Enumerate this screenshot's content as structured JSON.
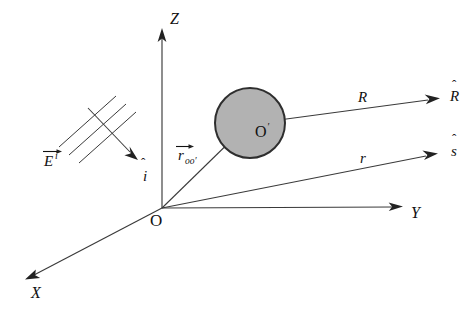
{
  "figure": {
    "background_color": "#ffffff",
    "line_color": "#3a3a3a",
    "sphere_fill_color": "#b2b2b2",
    "sphere_stroke_color": "#2e2e2e"
  },
  "axes": {
    "z": {
      "label": "Z",
      "name": "z-axis"
    },
    "y": {
      "label": "Y",
      "name": "y-axis"
    },
    "x": {
      "label": "X",
      "name": "x-axis"
    }
  },
  "origins": {
    "global": {
      "label": "O"
    },
    "local": {
      "label": "O",
      "prime": "′"
    }
  },
  "vectors": {
    "r_oo_prime": {
      "base": "r",
      "subscript": "oo′",
      "description": "position vector from O to O-prime"
    },
    "R": {
      "label": "R",
      "unit_base": "R",
      "unit_hat": "ˆ",
      "description": "scattered direction from sphere center"
    },
    "r": {
      "label": "r",
      "unit_base": "s",
      "unit_hat": "ˆ",
      "description": "observation direction from global origin"
    },
    "incident_field": {
      "base": "E",
      "superscript": "i",
      "description": "incident electric field"
    },
    "incident_direction": {
      "base": "i",
      "hat": "ˆ",
      "description": "incident propagation unit vector"
    }
  },
  "scatterer": {
    "name": "sphere",
    "center_label": "O′"
  }
}
